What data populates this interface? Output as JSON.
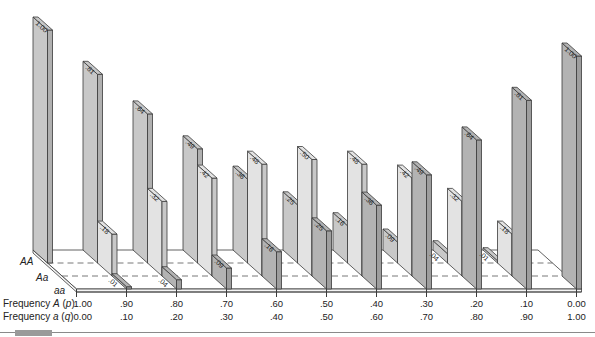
{
  "chart_data": {
    "type": "bar",
    "variant": "3d-oblique-grouped",
    "title": "",
    "xlabel": "Frequency A (p) / Frequency a (q)",
    "ylabel": "",
    "ylim": [
      0,
      1
    ],
    "grid": false,
    "legend": "row labels at left of floor (AA back, Aa middle, aa front)",
    "categories_p": [
      "1.00",
      ".90",
      ".80",
      ".70",
      ".60",
      ".50",
      ".40",
      ".30",
      ".20",
      ".10",
      "0.00"
    ],
    "categories_q": [
      "0.00",
      ".10",
      ".20",
      ".30",
      ".40",
      ".50",
      ".60",
      ".70",
      ".80",
      ".90",
      "1.00"
    ],
    "series": [
      {
        "name": "AA",
        "color": "#c8c8c8",
        "values": [
          1.0,
          0.81,
          0.64,
          0.49,
          0.36,
          0.25,
          0.16,
          0.09,
          0.04,
          0.01,
          null
        ],
        "labels": [
          "1.00",
          ".81",
          ".64",
          ".49",
          ".36",
          ".25",
          ".16",
          ".09",
          ".04",
          ".01",
          ""
        ]
      },
      {
        "name": "Aa",
        "color": "#e3e3e3",
        "values": [
          null,
          0.18,
          0.32,
          0.42,
          0.48,
          0.5,
          0.48,
          0.42,
          0.32,
          0.18,
          null
        ],
        "labels": [
          "",
          ".18",
          ".32",
          ".42",
          ".48",
          ".50",
          ".48",
          ".42",
          ".32",
          ".18",
          ""
        ]
      },
      {
        "name": "aa",
        "color": "#b3b3b3",
        "values": [
          null,
          0.01,
          0.04,
          0.09,
          0.16,
          0.25,
          0.36,
          0.49,
          0.64,
          0.81,
          1.0
        ],
        "labels": [
          "",
          ".01",
          ".04",
          ".09",
          ".16",
          ".25",
          ".36",
          ".49",
          ".64",
          ".81",
          "1.00"
        ]
      }
    ]
  },
  "row_labels": [
    "AA",
    "Aa",
    "aa"
  ],
  "axis_rows": {
    "p": {
      "prefix": "Frequency ",
      "allele": "A",
      "open": " (",
      "param": "p",
      "close": ")"
    },
    "q": {
      "prefix": "Frequency ",
      "allele": "a",
      "open": " (",
      "param": "q",
      "close": ")"
    }
  },
  "colors": {
    "outline": "#3a3a3a",
    "floor": "#ffffff",
    "dash": "#555555",
    "rule": "#8a8a8a"
  }
}
